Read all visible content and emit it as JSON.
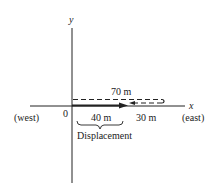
{
  "axes": {
    "y_label": "y",
    "x_label": "x",
    "origin_label": "0",
    "west_label": "(west)",
    "east_label": "(east)"
  },
  "path": {
    "total_distance_label": "70 m",
    "segment1_label": "40 m",
    "segment2_label": "30 m",
    "displacement_label": "Displacement"
  },
  "colors": {
    "ink": "#222222",
    "background": "#ffffff"
  }
}
